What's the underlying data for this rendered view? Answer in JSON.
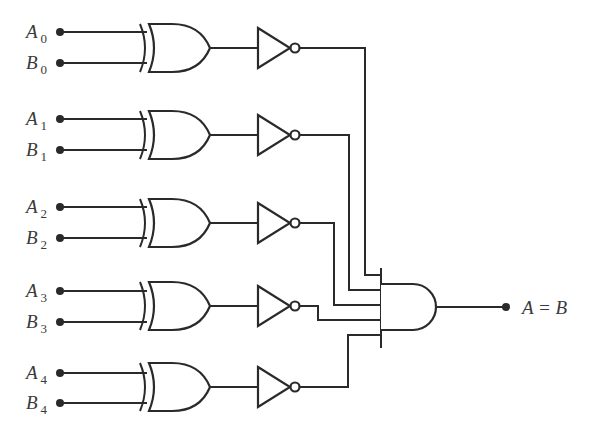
{
  "diagram": {
    "stages": [
      {
        "a_label": "A",
        "b_label": "B",
        "index": "0",
        "ya": 32,
        "yb": 63,
        "yo": 48,
        "and_y": 275,
        "route": "v365"
      },
      {
        "a_label": "A",
        "b_label": "B",
        "index": "1",
        "ya": 119,
        "yb": 150,
        "yo": 135,
        "and_y": 290,
        "route": "v349"
      },
      {
        "a_label": "A",
        "b_label": "B",
        "index": "2",
        "ya": 207,
        "yb": 238,
        "yo": 223,
        "and_y": 305,
        "route": "v334"
      },
      {
        "a_label": "A",
        "b_label": "B",
        "index": "3",
        "ya": 291,
        "yb": 322,
        "yo": 306,
        "and_y": 320,
        "route": "v318"
      },
      {
        "a_label": "A",
        "b_label": "B",
        "index": "4",
        "ya": 373,
        "yb": 403,
        "yo": 387,
        "and_y": 335,
        "route": "v348"
      }
    ],
    "gates": {
      "xor_count": 5,
      "not_count": 5,
      "and_inputs": 5
    },
    "output": {
      "label": "A = B"
    },
    "colors": {
      "line": "#2a2a2a",
      "text": "#3a3a3a",
      "background": "#ffffff"
    }
  }
}
